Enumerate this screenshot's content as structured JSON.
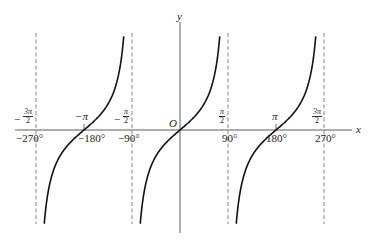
{
  "chart_data": {
    "type": "line",
    "title": "",
    "function": "y = tan x",
    "xlabel": "x",
    "ylabel": "y",
    "origin_label": "O",
    "x_ticks_degrees": [
      "-270°",
      "-180°",
      "-90°",
      "90°",
      "180°",
      "270°"
    ],
    "x_ticks_radians": [
      "-3π/2",
      "-π",
      "-π/2",
      "π/2",
      "π",
      "3π/2"
    ],
    "x_tick_values_deg": [
      -270,
      -180,
      -90,
      90,
      180,
      270
    ],
    "asymptotes_deg": [
      -270,
      -90,
      90,
      270
    ],
    "asymptote_style": "dashed",
    "zeros_deg": [
      -180,
      0,
      180
    ],
    "xlim_deg": [
      -310,
      330
    ],
    "grid": false,
    "legend": null,
    "series": [
      {
        "name": "branch-1",
        "x_range_deg": [
          -270,
          -90
        ],
        "center_deg": -180
      },
      {
        "name": "branch-2",
        "x_range_deg": [
          -90,
          90
        ],
        "center_deg": 0
      },
      {
        "name": "branch-3",
        "x_range_deg": [
          90,
          270
        ],
        "center_deg": 180
      }
    ]
  },
  "labels": {
    "x_axis": "x",
    "y_axis": "y",
    "origin": "O",
    "deg_m270": "−270°",
    "deg_m180": "−180°",
    "deg_m90": "−90°",
    "deg_90": "90°",
    "deg_180": "180°",
    "deg_270": "270°",
    "rad_m3pi2_num": "3π",
    "rad_m3pi2_den": "2",
    "rad_mpi": "−π",
    "rad_mpi2_num": "π",
    "rad_mpi2_den": "2",
    "rad_pi2_num": "π",
    "rad_pi2_den": "2",
    "rad_pi": "π",
    "rad_3pi2_num": "3π",
    "rad_3pi2_den": "2",
    "minus": "−"
  },
  "colors": {
    "curve": "#111111",
    "axis": "#333333",
    "asymptote": "#555555",
    "background": "#ffffff"
  }
}
